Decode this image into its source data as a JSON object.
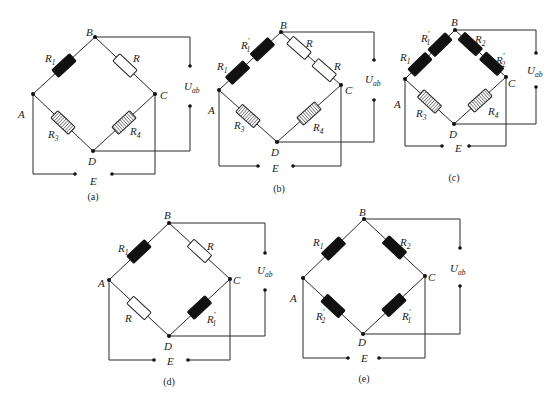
{
  "figure": {
    "colors": {
      "wire": "#2a2a2a",
      "active_gauge": "#111111",
      "fixed_resistor": "#ffffff",
      "compensation_gauge_hatch": "#222222"
    }
  },
  "diagrams": [
    {
      "id": "a",
      "caption": "(a)",
      "nodes": {
        "A": [
          33,
          94
        ],
        "B": [
          95,
          37
        ],
        "C": [
          155,
          94
        ],
        "D": [
          93,
          151
        ]
      },
      "node_labels": [
        {
          "text": "A",
          "x": 18,
          "y": 118
        },
        {
          "text": "B",
          "x": 86,
          "y": 36
        },
        {
          "text": "C",
          "x": 160,
          "y": 99
        },
        {
          "text": "D",
          "x": 88,
          "y": 165
        }
      ],
      "arms": [
        {
          "from": "A",
          "to": "B",
          "resistors": [
            {
              "type": "black",
              "t": 0.5
            }
          ],
          "labels": [
            {
              "main": "R",
              "sub": "1",
              "prime": "",
              "x": 45,
              "y": 62
            }
          ]
        },
        {
          "from": "B",
          "to": "C",
          "resistors": [
            {
              "type": "white",
              "t": 0.5
            }
          ],
          "labels": [
            {
              "main": "R",
              "sub": "",
              "prime": "",
              "x": 133,
              "y": 62
            }
          ]
        },
        {
          "from": "A",
          "to": "D",
          "resistors": [
            {
              "type": "hatch",
              "t": 0.5
            }
          ],
          "labels": [
            {
              "main": "R",
              "sub": "3",
              "prime": "",
              "x": 48,
              "y": 138
            }
          ]
        },
        {
          "from": "D",
          "to": "C",
          "resistors": [
            {
              "type": "hatch",
              "t": 0.5
            }
          ],
          "labels": [
            {
              "main": "R",
              "sub": "4",
              "prime": "",
              "x": 130,
              "y": 135
            }
          ]
        }
      ],
      "bottom_y": 174,
      "e_dots": [
        75,
        112
      ],
      "e_label": {
        "text": "E",
        "x": 90,
        "y": 185
      },
      "uab": {
        "x": 190,
        "top_dot_y": 66,
        "bottom_dot_y": 106,
        "label": "U",
        "sub": "ab",
        "label_x": 184,
        "label_y": 90
      },
      "caption_pos": [
        93,
        200
      ]
    },
    {
      "id": "b",
      "caption": "(b)",
      "nodes": {
        "A": [
          219,
          90
        ],
        "B": [
          281,
          32
        ],
        "C": [
          341,
          85
        ],
        "D": [
          277,
          142
        ]
      },
      "node_labels": [
        {
          "text": "A",
          "x": 208,
          "y": 114
        },
        {
          "text": "B",
          "x": 280,
          "y": 29
        },
        {
          "text": "C",
          "x": 345,
          "y": 94
        },
        {
          "text": "D",
          "x": 271,
          "y": 156
        }
      ],
      "arms": [
        {
          "from": "A",
          "to": "B",
          "resistors": [
            {
              "type": "black",
              "t": 0.3
            },
            {
              "type": "black",
              "t": 0.7
            }
          ],
          "labels": [
            {
              "main": "R",
              "sub": "1",
              "prime": "",
              "x": 217,
              "y": 70
            },
            {
              "main": "R",
              "sub": "1",
              "prime": "′",
              "x": 241,
              "y": 49
            }
          ]
        },
        {
          "from": "B",
          "to": "C",
          "resistors": [
            {
              "type": "white",
              "t": 0.3
            },
            {
              "type": "white",
              "t": 0.72
            }
          ],
          "labels": [
            {
              "main": "R",
              "sub": "",
              "prime": "",
              "x": 306,
              "y": 47
            },
            {
              "main": "R",
              "sub": "",
              "prime": "",
              "x": 334,
              "y": 70
            }
          ]
        },
        {
          "from": "A",
          "to": "D",
          "resistors": [
            {
              "type": "hatch",
              "t": 0.5
            }
          ],
          "labels": [
            {
              "main": "R",
              "sub": "3",
              "prime": "",
              "x": 234,
              "y": 129
            }
          ]
        },
        {
          "from": "D",
          "to": "C",
          "resistors": [
            {
              "type": "hatch",
              "t": 0.5
            }
          ],
          "labels": [
            {
              "main": "R",
              "sub": "4",
              "prime": "",
              "x": 313,
              "y": 131
            }
          ]
        }
      ],
      "bottom_y": 166,
      "e_dots": [
        258,
        293
      ],
      "e_label": {
        "text": "E",
        "x": 272,
        "y": 172
      },
      "uab": {
        "x": 374,
        "top_dot_y": 60,
        "bottom_dot_y": 100,
        "label": "U",
        "sub": "ab",
        "label_x": 365,
        "label_y": 83
      },
      "caption_pos": [
        279,
        192
      ]
    },
    {
      "id": "c",
      "caption": "(c)",
      "nodes": {
        "A": [
          405,
          79
        ],
        "B": [
          455,
          30
        ],
        "C": [
          506,
          77
        ],
        "D": [
          454,
          124
        ]
      },
      "node_labels": [
        {
          "text": "A",
          "x": 394,
          "y": 108
        },
        {
          "text": "B",
          "x": 451,
          "y": 26
        },
        {
          "text": "C",
          "x": 508,
          "y": 87
        },
        {
          "text": "D",
          "x": 449,
          "y": 138
        }
      ],
      "arms": [
        {
          "from": "A",
          "to": "B",
          "resistors": [
            {
              "type": "black",
              "t": 0.3
            },
            {
              "type": "black",
              "t": 0.7
            }
          ],
          "labels": [
            {
              "main": "R",
              "sub": "1",
              "prime": "",
              "x": 400,
              "y": 61
            },
            {
              "main": "R",
              "sub": "1",
              "prime": "′",
              "x": 421,
              "y": 42
            }
          ]
        },
        {
          "from": "B",
          "to": "C",
          "resistors": [
            {
              "type": "black",
              "t": 0.3
            },
            {
              "type": "black",
              "t": 0.72
            }
          ],
          "labels": [
            {
              "main": "R",
              "sub": "2",
              "prime": "",
              "x": 475,
              "y": 43
            },
            {
              "main": "R",
              "sub": "2",
              "prime": "′",
              "x": 496,
              "y": 64
            }
          ]
        },
        {
          "from": "A",
          "to": "D",
          "resistors": [
            {
              "type": "hatch",
              "t": 0.5
            }
          ],
          "labels": [
            {
              "main": "R",
              "sub": "3",
              "prime": "",
              "x": 416,
              "y": 117
            }
          ]
        },
        {
          "from": "D",
          "to": "C",
          "resistors": [
            {
              "type": "hatch",
              "t": 0.5
            }
          ],
          "labels": [
            {
              "main": "R",
              "sub": "4",
              "prime": "",
              "x": 488,
              "y": 115
            }
          ]
        }
      ],
      "bottom_y": 146,
      "e_dots": [
        442,
        469
      ],
      "e_label": {
        "text": "E",
        "x": 455,
        "y": 152
      },
      "uab": {
        "x": 536,
        "top_dot_y": 53,
        "bottom_dot_y": 87,
        "label": "U",
        "sub": "ab",
        "label_x": 527,
        "label_y": 74
      },
      "caption_pos": [
        454,
        181
      ]
    },
    {
      "id": "d",
      "caption": "(d)",
      "nodes": {
        "A": [
          109,
          280
        ],
        "B": [
          169,
          223
        ],
        "C": [
          230,
          279
        ],
        "D": [
          169,
          336
        ]
      },
      "node_labels": [
        {
          "text": "A",
          "x": 98,
          "y": 287
        },
        {
          "text": "B",
          "x": 164,
          "y": 219
        },
        {
          "text": "C",
          "x": 233,
          "y": 284
        },
        {
          "text": "D",
          "x": 164,
          "y": 350
        }
      ],
      "arms": [
        {
          "from": "A",
          "to": "B",
          "resistors": [
            {
              "type": "black",
              "t": 0.5
            }
          ],
          "labels": [
            {
              "main": "R",
              "sub": "1",
              "prime": "",
              "x": 118,
              "y": 252
            }
          ]
        },
        {
          "from": "B",
          "to": "C",
          "resistors": [
            {
              "type": "white",
              "t": 0.5
            }
          ],
          "labels": [
            {
              "main": "R",
              "sub": "",
              "prime": "",
              "x": 207,
              "y": 250
            }
          ]
        },
        {
          "from": "A",
          "to": "D",
          "resistors": [
            {
              "type": "white",
              "t": 0.5
            }
          ],
          "labels": [
            {
              "main": "R",
              "sub": "",
              "prime": "",
              "x": 125,
              "y": 322
            }
          ]
        },
        {
          "from": "D",
          "to": "C",
          "resistors": [
            {
              "type": "black",
              "t": 0.5
            }
          ],
          "labels": [
            {
              "main": "R",
              "sub": "1",
              "prime": "′",
              "x": 207,
              "y": 323
            }
          ]
        }
      ],
      "bottom_y": 360,
      "e_dots": [
        154,
        188
      ],
      "e_label": {
        "text": "E",
        "x": 167,
        "y": 365
      },
      "uab": {
        "x": 265,
        "top_dot_y": 253,
        "bottom_dot_y": 290,
        "label": "U",
        "sub": "ab",
        "label_x": 257,
        "label_y": 274
      },
      "caption_pos": [
        169,
        385
      ]
    },
    {
      "id": "e",
      "caption": "(e)",
      "nodes": {
        "A": [
          303,
          278
        ],
        "B": [
          364,
          219
        ],
        "C": [
          425,
          276
        ],
        "D": [
          363,
          334
        ]
      },
      "node_labels": [
        {
          "text": "A",
          "x": 290,
          "y": 302
        },
        {
          "text": "B",
          "x": 359,
          "y": 216
        },
        {
          "text": "C",
          "x": 428,
          "y": 281
        },
        {
          "text": "D",
          "x": 358,
          "y": 346
        }
      ],
      "arms": [
        {
          "from": "A",
          "to": "B",
          "resistors": [
            {
              "type": "black",
              "t": 0.5
            }
          ],
          "labels": [
            {
              "main": "R",
              "sub": "1",
              "prime": "",
              "x": 313,
              "y": 246
            }
          ]
        },
        {
          "from": "B",
          "to": "C",
          "resistors": [
            {
              "type": "black",
              "t": 0.5
            }
          ],
          "labels": [
            {
              "main": "R",
              "sub": "2",
              "prime": "",
              "x": 400,
              "y": 246
            }
          ]
        },
        {
          "from": "A",
          "to": "D",
          "resistors": [
            {
              "type": "black",
              "t": 0.5
            }
          ],
          "labels": [
            {
              "main": "R",
              "sub": "2",
              "prime": "′",
              "x": 316,
              "y": 320
            }
          ]
        },
        {
          "from": "D",
          "to": "C",
          "resistors": [
            {
              "type": "black",
              "t": 0.5
            }
          ],
          "labels": [
            {
              "main": "R",
              "sub": "1",
              "prime": "′",
              "x": 402,
              "y": 320
            }
          ]
        }
      ],
      "bottom_y": 358,
      "e_dots": [
        348,
        379
      ],
      "e_label": {
        "text": "E",
        "x": 361,
        "y": 362
      },
      "uab": {
        "x": 460,
        "top_dot_y": 248,
        "bottom_dot_y": 286,
        "label": "U",
        "sub": "ab",
        "label_x": 450,
        "label_y": 272
      },
      "caption_pos": [
        364,
        382
      ]
    }
  ]
}
